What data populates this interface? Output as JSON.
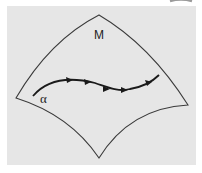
{
  "diagram": {
    "surface_label": "M",
    "curve_label": "α",
    "colors": {
      "background": "#ffffff",
      "panel": "#e6e6e6",
      "outline": "#3a3a3a",
      "curve": "#1a1a1a",
      "corner_arc": "#9a9a9a"
    }
  }
}
